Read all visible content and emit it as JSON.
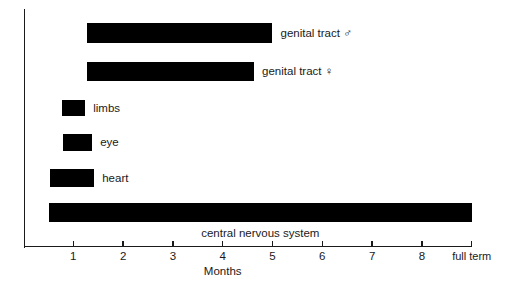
{
  "chart_data": {
    "type": "bar",
    "orientation": "horizontal",
    "title": "",
    "subtitle": "",
    "xlabel": "Months",
    "ylabel": "",
    "xlim": [
      0,
      9
    ],
    "grid": false,
    "legend": "none",
    "bar_color": "#000000",
    "axis_color": "#1a1a1a",
    "xticks": [
      {
        "value": 1,
        "label": "1"
      },
      {
        "value": 2,
        "label": "2"
      },
      {
        "value": 3,
        "label": "3"
      },
      {
        "value": 4,
        "label": "4"
      },
      {
        "value": 5,
        "label": "5"
      },
      {
        "value": 6,
        "label": "6"
      },
      {
        "value": 7,
        "label": "7"
      },
      {
        "value": 8,
        "label": "8"
      },
      {
        "value": 9,
        "label": "full term"
      }
    ],
    "categories": [
      "genital tract ♂",
      "genital tract ♀",
      "limbs",
      "eye",
      "heart",
      "central nervous system"
    ],
    "bars": [
      {
        "name": "genital-tract-male",
        "label": "genital tract ♂",
        "start": 1.28,
        "end": 5.0,
        "row": 0,
        "label_position": "right"
      },
      {
        "name": "genital-tract-female",
        "label": "genital tract ♀",
        "start": 1.28,
        "end": 4.63,
        "row": 1,
        "label_position": "right"
      },
      {
        "name": "limbs",
        "label": "limbs",
        "start": 0.77,
        "end": 1.24,
        "row": 2,
        "label_position": "right"
      },
      {
        "name": "eye",
        "label": "eye",
        "start": 0.79,
        "end": 1.38,
        "row": 3,
        "label_position": "right"
      },
      {
        "name": "heart",
        "label": "heart",
        "start": 0.53,
        "end": 1.42,
        "row": 4,
        "label_position": "right"
      },
      {
        "name": "central-nervous-system",
        "label": "central nervous system",
        "start": 0.51,
        "end": 9.0,
        "row": 5,
        "label_position": "below-center"
      }
    ]
  },
  "axis": {
    "x_title": "Months",
    "full_term_label": "full term"
  },
  "labels": {
    "genital_tract_male": "genital tract ♂",
    "genital_tract_female": "genital tract ♀",
    "limbs": "limbs",
    "eye": "eye",
    "heart": "heart",
    "central_nervous_system": "central nervous system",
    "months": "Months",
    "tick_1": "1",
    "tick_2": "2",
    "tick_3": "3",
    "tick_4": "4",
    "tick_5": "5",
    "tick_6": "6",
    "tick_7": "7",
    "tick_8": "8",
    "tick_full_term": "full term"
  }
}
